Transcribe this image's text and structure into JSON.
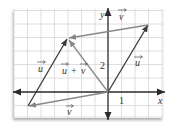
{
  "diagram": {
    "title": "",
    "type": "vector-addition-parallelogram",
    "grid": {
      "unit_px": 13.5,
      "origin_px": [
        108,
        92
      ],
      "x_range": [
        -7,
        4
      ],
      "y_range": [
        -2,
        6
      ],
      "color": "#d6d6d6"
    },
    "axes": {
      "x_label": "x",
      "y_label": "y",
      "x_tick_label": "1",
      "y_tick_label": "2",
      "color": "#2a2a2a"
    },
    "vectors": [
      {
        "id": "u-right",
        "label": "u",
        "from": [
          0,
          0
        ],
        "to": [
          3,
          5
        ],
        "color": "#3a3a3a"
      },
      {
        "id": "v-top",
        "label": "v",
        "from": [
          3,
          5
        ],
        "to": [
          -3,
          4
        ],
        "color": "#888888"
      },
      {
        "id": "u-left",
        "label": "u",
        "from": [
          -6,
          -1
        ],
        "to": [
          -3,
          4
        ],
        "color": "#3a3a3a"
      },
      {
        "id": "v-bottom",
        "label": "v",
        "from": [
          0,
          0
        ],
        "to": [
          -6,
          -1
        ],
        "color": "#888888"
      },
      {
        "id": "u-plus-v",
        "label": "u + v",
        "from": [
          0,
          0
        ],
        "to": [
          -3,
          4
        ],
        "color": "#888888"
      }
    ],
    "labels": {
      "u_right": "u",
      "u_left": "u",
      "v_top": "v",
      "v_bottom": "v",
      "u_plus_v": "u + v",
      "u_plus_v_u": "u",
      "u_plus_v_plus": "+",
      "u_plus_v_v": "v"
    }
  }
}
